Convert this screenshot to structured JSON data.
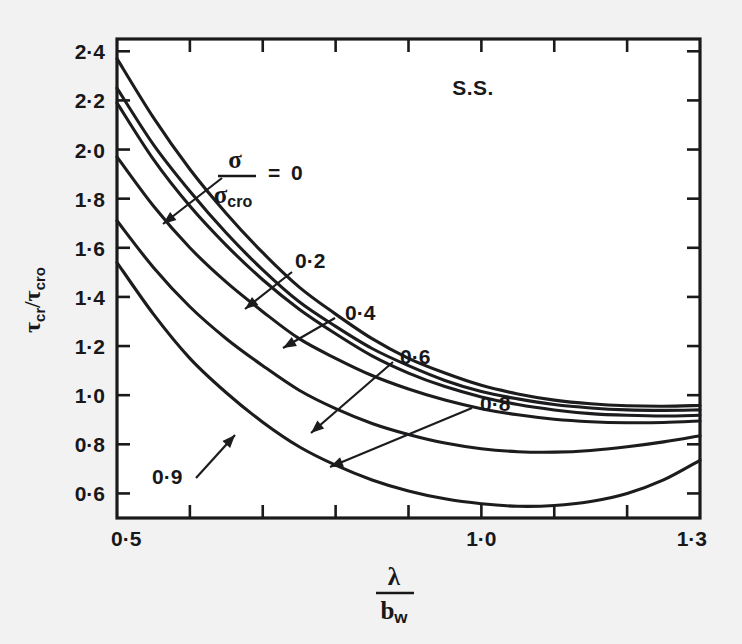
{
  "figure": {
    "background_color": "#f2f2f2",
    "plot_background_color": "#ffffff",
    "line_color": "#1c1c1e",
    "annotation": "S.S."
  },
  "axes": {
    "y_label_num": "τ",
    "y_label_num_sub": "cr",
    "y_label_sep": "/",
    "y_label_den": "τ",
    "y_label_den_sub": "cro",
    "y_label_full": "τcr/τcro",
    "x_label_num": "λ",
    "x_label_den": "b",
    "x_label_den_sub": "w",
    "x_label_full": "λ/bw",
    "y_ticks": [
      "2·4",
      "2·2",
      "2·0",
      "1·8",
      "1·6",
      "1·4",
      "1·2",
      "1·0",
      "0·8",
      "0·6"
    ],
    "y_tick_values": [
      2.4,
      2.2,
      2.0,
      1.8,
      1.6,
      1.4,
      1.2,
      1.0,
      0.8,
      0.6
    ],
    "x_ticks_labeled": [
      "0·5",
      "1·0",
      "1·3"
    ],
    "x_tick_values_labeled": [
      0.5,
      1.0,
      1.3
    ],
    "x_tick_values_all": [
      0.5,
      0.6,
      0.7,
      0.8,
      0.9,
      1.0,
      1.1,
      1.2,
      1.3
    ]
  },
  "series_legend": {
    "param_num": "σ",
    "param_den": "σ",
    "param_den_sub": "cro",
    "equals": "=",
    "first_value": "0",
    "other_values": [
      "0·2",
      "0·4",
      "0·6",
      "0·8",
      "0·9"
    ]
  },
  "chart_data": {
    "type": "line",
    "title": "",
    "subtitle": "",
    "annotation": "S.S.",
    "xlabel": "λ/bw",
    "ylabel": "τcr/τcro",
    "xlim": [
      0.5,
      1.3
    ],
    "ylim": [
      0.5,
      2.45
    ],
    "xticks": [
      0.5,
      0.6,
      0.7,
      0.8,
      0.9,
      1.0,
      1.1,
      1.2,
      1.3
    ],
    "xtick_labels": [
      "0·5",
      "",
      "",
      "",
      "",
      "1·0",
      "",
      "",
      "1·3"
    ],
    "yticks": [
      0.6,
      0.8,
      1.0,
      1.2,
      1.4,
      1.6,
      1.8,
      2.0,
      2.2,
      2.4
    ],
    "ytick_labels": [
      "0·6",
      "0·8",
      "1·0",
      "1·2",
      "1·4",
      "1·6",
      "1·8",
      "2·0",
      "2·2",
      "2·4"
    ],
    "grid": false,
    "legend_position": "inline-labels",
    "x": [
      0.5,
      0.55,
      0.6,
      0.65,
      0.7,
      0.75,
      0.8,
      0.85,
      0.9,
      0.95,
      1.0,
      1.05,
      1.1,
      1.15,
      1.2,
      1.25,
      1.3
    ],
    "series": [
      {
        "name": "σ/σcro = 0",
        "label": "0",
        "values": [
          2.37,
          2.13,
          1.92,
          1.74,
          1.58,
          1.44,
          1.33,
          1.23,
          1.15,
          1.09,
          1.04,
          1.005,
          0.98,
          0.965,
          0.957,
          0.955,
          0.958
        ]
      },
      {
        "name": "σ/σcro = 0.2",
        "label": "0·2",
        "values": [
          2.25,
          2.02,
          1.83,
          1.66,
          1.51,
          1.38,
          1.28,
          1.19,
          1.12,
          1.06,
          1.015,
          0.985,
          0.962,
          0.948,
          0.94,
          0.938,
          0.94
        ]
      },
      {
        "name": "σ/σcro = 0.4",
        "label": "0·4",
        "values": [
          2.19,
          1.96,
          1.77,
          1.61,
          1.47,
          1.35,
          1.25,
          1.16,
          1.09,
          1.035,
          0.993,
          0.962,
          0.94,
          0.925,
          0.918,
          0.915,
          0.918
        ]
      },
      {
        "name": "σ/σcro = 0.6",
        "label": "0·6",
        "values": [
          1.97,
          1.77,
          1.6,
          1.46,
          1.34,
          1.23,
          1.15,
          1.08,
          1.025,
          0.98,
          0.945,
          0.92,
          0.902,
          0.892,
          0.888,
          0.889,
          0.895
        ]
      },
      {
        "name": "σ/σcro = 0.8",
        "label": "0·8",
        "values": [
          1.71,
          1.52,
          1.36,
          1.23,
          1.12,
          1.02,
          0.945,
          0.885,
          0.84,
          0.805,
          0.782,
          0.77,
          0.768,
          0.775,
          0.79,
          0.81,
          0.835
        ]
      },
      {
        "name": "σ/σcro = 0.9",
        "label": "0·9",
        "values": [
          1.54,
          1.33,
          1.15,
          1.01,
          0.89,
          0.79,
          0.715,
          0.655,
          0.61,
          0.578,
          0.558,
          0.548,
          0.551,
          0.567,
          0.6,
          0.655,
          0.735
        ]
      }
    ]
  }
}
